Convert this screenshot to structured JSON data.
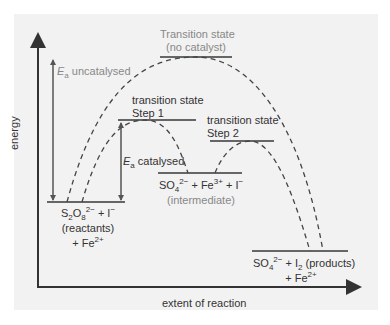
{
  "diagram": {
    "type": "reaction-energy-profile",
    "axes": {
      "y_label": "energy",
      "x_label": "extent of reaction"
    },
    "levels": {
      "reactants": {
        "line1_a": "S",
        "line1_sub1": "2",
        "line1_b": "O",
        "line1_sub2": "8",
        "line1_sup": "2−",
        "line1_c": " + I",
        "line1_sup2": "−",
        "line2": "(reactants)",
        "line3_a": "+ Fe",
        "line3_sup": "2+"
      },
      "intermediate": {
        "line1_a": "SO",
        "line1_sub": "4",
        "line1_sup": "2−",
        "line1_b": " + Fe",
        "line1_sup2": "3+",
        "line1_c": " + I",
        "line1_sup3": "−",
        "line2": "(intermediate)"
      },
      "products": {
        "line1_a": "SO",
        "line1_sub": "4",
        "line1_sup": "2−",
        "line1_b": " + I",
        "line1_sub2": "2",
        "line1_c": " (products)",
        "line2_a": "+ Fe",
        "line2_sup": "2+"
      },
      "ts_uncatalysed": {
        "line1": "Transition state",
        "line2": "(no catalyst)"
      },
      "ts_step1": {
        "line1": "transition state",
        "line2": "Step 1"
      },
      "ts_step2": {
        "line1": "transition state",
        "line2": "Step 2"
      }
    },
    "annotations": {
      "ea_uncat_symbol": "E",
      "ea_uncat_sub": "a",
      "ea_uncat_text": " uncatalysed",
      "ea_cat_symbol": "E",
      "ea_cat_sub": "a",
      "ea_cat_text": " catalysed"
    },
    "colors": {
      "panel": "#f2f2f2",
      "axis": "#333333",
      "level_line": "#666666",
      "curve": "#444444",
      "grey_text": "#888888"
    }
  }
}
